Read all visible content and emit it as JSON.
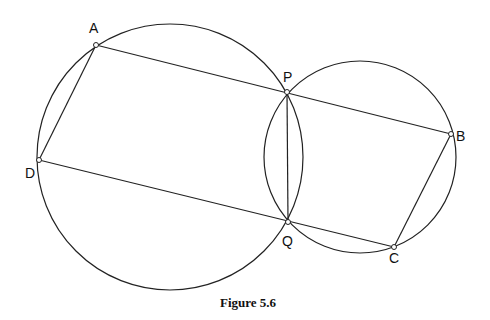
{
  "figure": {
    "caption": "Figure 5.6",
    "points": {
      "A": {
        "label": "A",
        "x": 96,
        "y": 45
      },
      "P": {
        "label": "P",
        "x": 287,
        "y": 92
      },
      "B": {
        "label": "B",
        "x": 451,
        "y": 134
      },
      "D": {
        "label": "D",
        "x": 39,
        "y": 160
      },
      "Q": {
        "label": "Q",
        "x": 288,
        "y": 222
      },
      "C": {
        "label": "C",
        "x": 394,
        "y": 247
      }
    },
    "circles": [
      {
        "name": "left-circle",
        "cx": 170,
        "cy": 157,
        "r": 133
      },
      {
        "name": "right-circle",
        "cx": 360,
        "cy": 157,
        "r": 96
      }
    ],
    "segments": [
      "AB",
      "DC",
      "AD",
      "BC",
      "PQ"
    ],
    "stroke_color": "#222222"
  }
}
